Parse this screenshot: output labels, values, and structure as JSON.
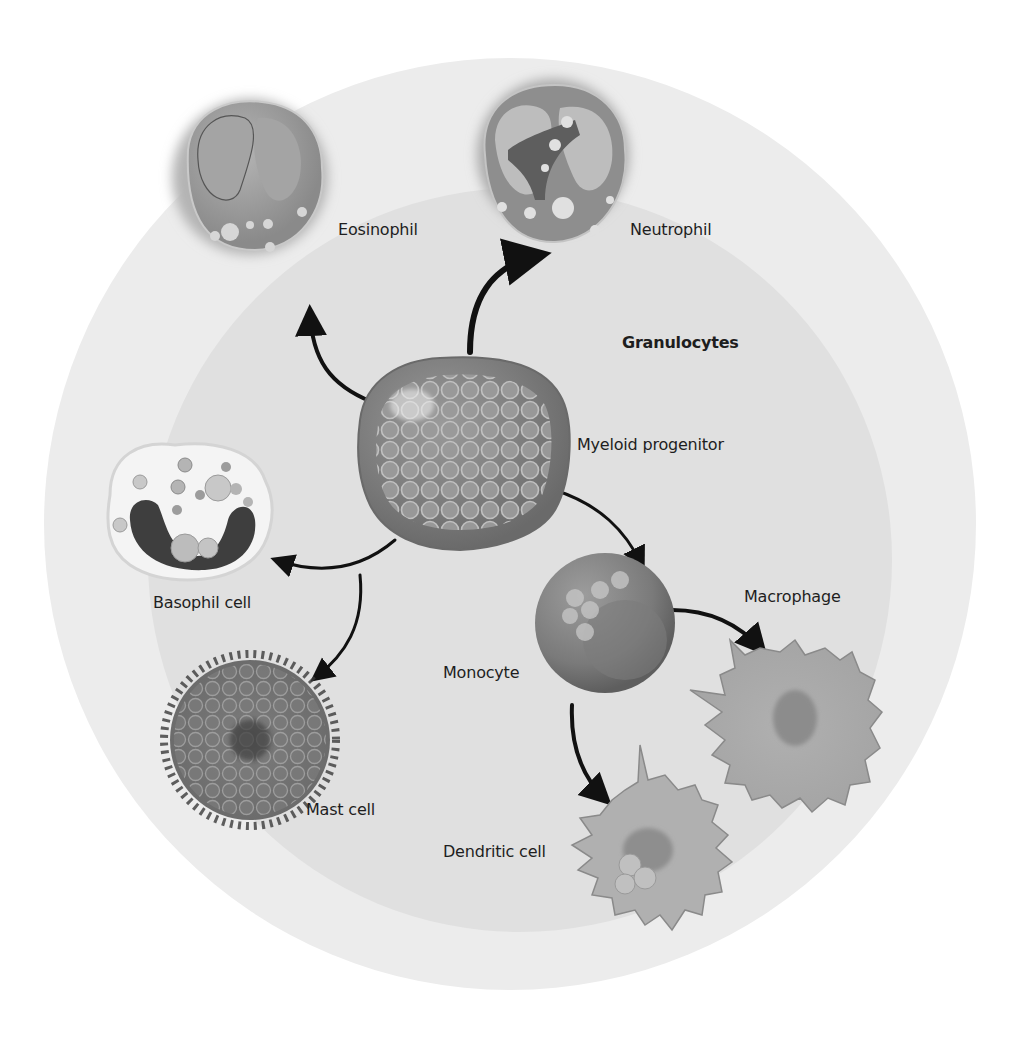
{
  "diagram": {
    "title": "Granulocytes",
    "progenitor": "Myeloid progenitor",
    "colors": {
      "page_bg": "#ffffff",
      "outer_disc": "#ececec",
      "inner_disc": "#e0e0e0",
      "cell_mid": "#8c8c8c",
      "cell_dark": "#5a5a5a",
      "arrow": "#111111",
      "text": "#1e1e1e"
    },
    "cells": [
      {
        "id": "eosinophil",
        "label": "Eosinophil"
      },
      {
        "id": "neutrophil",
        "label": "Neutrophil"
      },
      {
        "id": "basophil",
        "label": "Basophil cell"
      },
      {
        "id": "mast",
        "label": "Mast cell"
      },
      {
        "id": "monocyte",
        "label": "Monocyte"
      },
      {
        "id": "macrophage",
        "label": "Macrophage"
      },
      {
        "id": "dendritic",
        "label": "Dendritic cell"
      }
    ],
    "edges": [
      {
        "from": "Myeloid progenitor",
        "to": "Eosinophil"
      },
      {
        "from": "Myeloid progenitor",
        "to": "Neutrophil"
      },
      {
        "from": "Myeloid progenitor",
        "to": "Basophil cell"
      },
      {
        "from": "Myeloid progenitor",
        "to": "Mast cell"
      },
      {
        "from": "Myeloid progenitor",
        "to": "Monocyte"
      },
      {
        "from": "Monocyte",
        "to": "Macrophage"
      },
      {
        "from": "Monocyte",
        "to": "Dendritic cell"
      }
    ]
  }
}
